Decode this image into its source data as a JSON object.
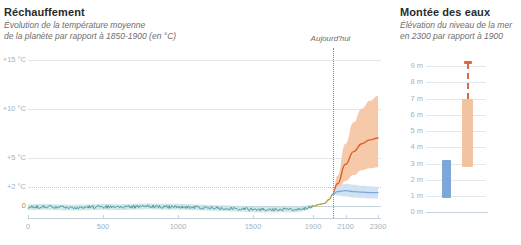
{
  "left_panel": {
    "title": "Réchauffement",
    "subtitle_line1": "Évolution de la température moyenne",
    "subtitle_line2": "de la planète par rapport à 1850-1900 (en °C)",
    "today_label": "Aujourd'hui"
  },
  "right_panel": {
    "title": "Montée des eaux",
    "subtitle_line1": "Élévation du niveau de la mer",
    "subtitle_line2": "en 2300 par rapport à 1900"
  },
  "colors": {
    "historical_line": "#3f8f96",
    "historical_band": "#bfe0e2",
    "transition_line": "#b9a23c",
    "high_scenario_line": "#d9622b",
    "high_scenario_band": "#f6c6a4",
    "low_scenario_line": "#7da7d9",
    "low_scenario_band": "#cfe0f2",
    "today_marker": "#b57a5a",
    "grid": "#dfe6ec",
    "axis_text": "#9fb3c4",
    "sea_blue_bar": "#7da7d9",
    "sea_orange_bar": "#f2c3a0",
    "sea_orange_cap": "#e0673c"
  },
  "chart_data": [
    {
      "type": "line",
      "id": "temperature-anomaly",
      "title": "Réchauffement",
      "subtitle": "Évolution de la température moyenne de la planète par rapport à 1850-1900 (en °C)",
      "xlabel": "",
      "ylabel": "°C",
      "xlim": [
        0,
        2300
      ],
      "ylim": [
        -1,
        15
      ],
      "grid": true,
      "legend_position": "none",
      "x_ticks": [
        0,
        500,
        1000,
        1500,
        1900,
        2100,
        2300
      ],
      "x_tick_labels": [
        "0",
        "500",
        "1000",
        "1500",
        "1900",
        "2100",
        "2300"
      ],
      "y_ticks": [
        0,
        2,
        5,
        10,
        15
      ],
      "y_tick_labels": [
        "0",
        "+2 °C",
        "+5 °C",
        "+10 °C",
        "+15 °C"
      ],
      "annotations": [
        {
          "text": "Aujourd'hui",
          "x": 2020,
          "style": "dotted-vertical-line"
        }
      ],
      "note": "x axis is non-linear: years 0-1900 occupy most of the width, 1900-2300 is compressed into the right portion",
      "series": [
        {
          "name": "Reconstruction historique",
          "color": "#3f8f96",
          "x": [
            0,
            100,
            200,
            300,
            400,
            500,
            600,
            700,
            800,
            900,
            1000,
            1100,
            1200,
            1300,
            1400,
            1500,
            1600,
            1700,
            1800,
            1850,
            1900
          ],
          "values": [
            -0.1,
            -0.05,
            -0.1,
            -0.15,
            -0.1,
            -0.05,
            -0.1,
            -0.05,
            0.0,
            -0.05,
            -0.05,
            -0.1,
            -0.15,
            -0.2,
            -0.25,
            -0.3,
            -0.35,
            -0.3,
            -0.3,
            -0.2,
            0.0
          ],
          "band_low": [
            -0.4,
            -0.35,
            -0.4,
            -0.45,
            -0.4,
            -0.35,
            -0.4,
            -0.35,
            -0.3,
            -0.35,
            -0.35,
            -0.4,
            -0.45,
            -0.5,
            -0.55,
            -0.6,
            -0.65,
            -0.6,
            -0.6,
            -0.45,
            -0.2
          ],
          "band_high": [
            0.2,
            0.25,
            0.2,
            0.15,
            0.2,
            0.25,
            0.2,
            0.25,
            0.3,
            0.25,
            0.25,
            0.2,
            0.15,
            0.1,
            0.05,
            0.0,
            -0.05,
            0.0,
            0.0,
            0.05,
            0.2
          ]
        },
        {
          "name": "Période de transition observée",
          "color": "#b9a23c",
          "x": [
            1900,
            1940,
            1970,
            2000,
            2020
          ],
          "values": [
            0.0,
            0.2,
            0.3,
            0.7,
            1.2
          ]
        },
        {
          "name": "Scénario haut (fortes émissions)",
          "color": "#d9622b",
          "x": [
            2020,
            2050,
            2100,
            2150,
            2200,
            2250,
            2300
          ],
          "values": [
            1.2,
            2.3,
            4.3,
            5.6,
            6.4,
            6.8,
            7.0
          ],
          "band_low": [
            1.2,
            1.6,
            2.6,
            3.2,
            3.7,
            3.9,
            4.0
          ],
          "band_high": [
            1.2,
            3.1,
            6.4,
            8.6,
            10.0,
            10.8,
            11.3
          ]
        },
        {
          "name": "Scénario bas (faibles émissions)",
          "color": "#7da7d9",
          "x": [
            2020,
            2050,
            2100,
            2150,
            2200,
            2250,
            2300
          ],
          "values": [
            1.2,
            1.5,
            1.6,
            1.5,
            1.45,
            1.4,
            1.4
          ],
          "band_low": [
            1.2,
            1.1,
            1.0,
            0.9,
            0.85,
            0.8,
            0.8
          ],
          "band_high": [
            1.2,
            2.0,
            2.3,
            2.2,
            2.1,
            2.05,
            2.0
          ]
        }
      ]
    },
    {
      "type": "bar",
      "id": "sea-level-rise",
      "title": "Montée des eaux",
      "subtitle": "Élévation du niveau de la mer en 2300 par rapport à 1900",
      "orientation": "vertical-range",
      "xlabel": "",
      "ylabel": "m",
      "ylim": [
        0,
        9
      ],
      "grid": true,
      "legend_position": "none",
      "y_ticks": [
        0,
        1,
        2,
        3,
        4,
        5,
        6,
        7,
        8,
        9
      ],
      "y_tick_labels": [
        "0 m",
        "1 m",
        "2 m",
        "3 m",
        "4 m",
        "5 m",
        "6 m",
        "7 m",
        "8 m",
        "9 m"
      ],
      "categories": [
        "Scénario bas",
        "Scénario haut"
      ],
      "ranges": [
        {
          "name": "Scénario bas",
          "color": "#7da7d9",
          "low": 0.9,
          "high": 3.2,
          "dashed_extension": null
        },
        {
          "name": "Scénario haut",
          "color": "#f2c3a0",
          "low": 2.8,
          "high": 7.0,
          "dashed_extension": 9.2
        }
      ]
    }
  ]
}
